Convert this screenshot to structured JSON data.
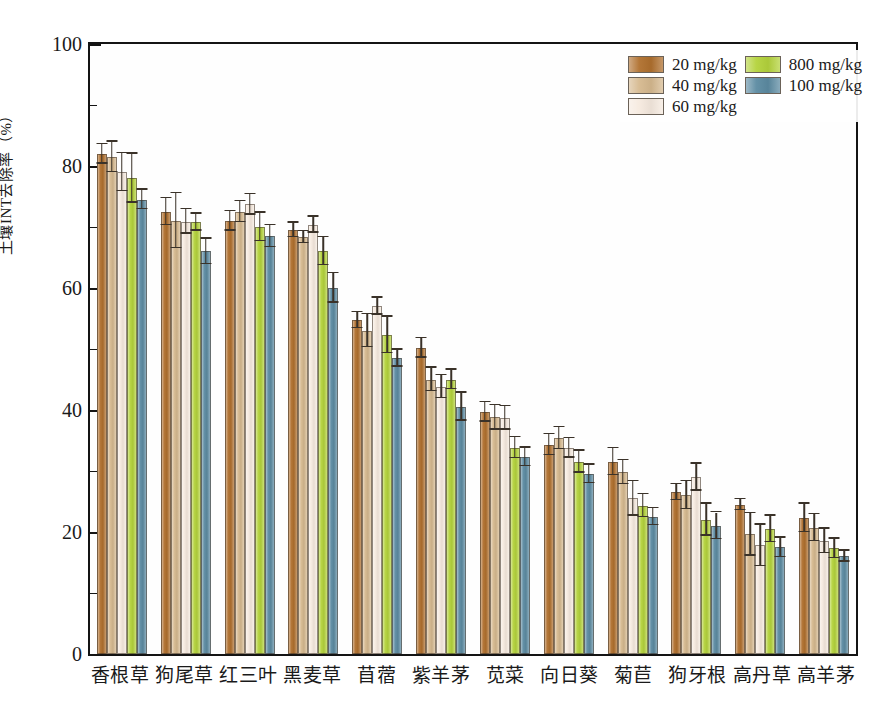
{
  "chart_data": {
    "type": "bar",
    "title": "",
    "xlabel": "",
    "ylabel": "土壤INT去除率（%）",
    "ylim": [
      0,
      100
    ],
    "yticks": [
      0,
      20,
      40,
      60,
      80,
      100
    ],
    "ytick_labels": [
      "0",
      "20",
      "40",
      "60",
      "80",
      "100"
    ],
    "grid": false,
    "legend_position": "top-right",
    "categories": [
      "香根草",
      "狗尾草",
      "红三叶",
      "黑麦草",
      "苜蓿",
      "紫羊茅",
      "苋菜",
      "向日葵",
      "菊苣",
      "狗牙根",
      "高丹草",
      "高羊茅"
    ],
    "series": [
      {
        "name": "20 mg/kg",
        "color": "#B0702E",
        "values": [
          82.0,
          72.5,
          71.0,
          69.5,
          54.7,
          50.2,
          39.7,
          34.3,
          31.5,
          26.5,
          24.5,
          22.3
        ],
        "errors": [
          1.6,
          2.2,
          1.6,
          1.2,
          1.3,
          1.6,
          1.6,
          1.7,
          2.2,
          1.3,
          0.9,
          2.3
        ]
      },
      {
        "name": "40 mg/kg",
        "color": "#D6B98F",
        "values": [
          81.5,
          71.0,
          72.5,
          68.3,
          53.0,
          45.0,
          38.8,
          35.4,
          29.8,
          26.0,
          19.6,
          20.7
        ],
        "errors": [
          2.5,
          4.5,
          1.7,
          1.0,
          2.7,
          1.9,
          2.0,
          1.8,
          2.0,
          2.3,
          3.5,
          2.2
        ]
      },
      {
        "name": "60 mg/kg",
        "color": "#F6EADF",
        "values": [
          79.0,
          70.9,
          73.7,
          70.4,
          57.0,
          43.8,
          38.7,
          33.8,
          25.5,
          29.0,
          17.8,
          18.5
        ],
        "errors": [
          3.1,
          2.0,
          1.7,
          1.3,
          1.4,
          1.9,
          1.9,
          1.6,
          2.8,
          2.2,
          3.4,
          2.0
        ]
      },
      {
        "name": "800 mg/kg",
        "color": "#B4D33C",
        "values": [
          78.0,
          70.8,
          70.0,
          66.0,
          52.3,
          45.0,
          33.8,
          31.5,
          24.3,
          22.0,
          20.5,
          17.3
        ],
        "errors": [
          4.0,
          1.4,
          2.3,
          2.3,
          3.0,
          1.6,
          1.7,
          1.8,
          1.9,
          2.6,
          2.2,
          1.6
        ]
      },
      {
        "name": "100 mg/kg",
        "color": "#5C8BA2",
        "values": [
          74.5,
          66.0,
          68.5,
          60.0,
          48.5,
          40.5,
          32.3,
          29.5,
          22.5,
          21.0,
          17.5,
          16.0
        ],
        "errors": [
          1.6,
          2.1,
          1.8,
          2.4,
          1.4,
          2.3,
          1.5,
          1.5,
          1.4,
          2.2,
          1.6,
          0.9
        ]
      }
    ]
  },
  "legend": {
    "entries": [
      {
        "label": "20 mg/kg",
        "color": "#B0702E"
      },
      {
        "label": "800 mg/kg",
        "color": "#B4D33C"
      },
      {
        "label": "40 mg/kg",
        "color": "#D6B98F"
      },
      {
        "label": "100 mg/kg",
        "color": "#5C8BA2"
      },
      {
        "label": "60 mg/kg",
        "color": "#F6EADF"
      }
    ]
  }
}
